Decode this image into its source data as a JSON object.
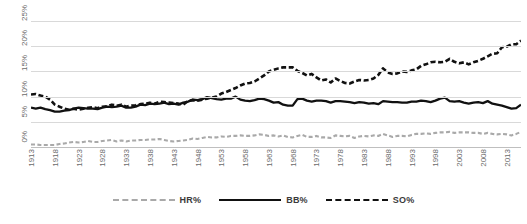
{
  "chart_data": {
    "type": "line",
    "title": "",
    "xlabel": "",
    "ylabel": "",
    "ylim": [
      0,
      25
    ],
    "ytick_labels": [
      "25%",
      "20%",
      "15%",
      "10%",
      "5%",
      "0%"
    ],
    "ytick_values": [
      25,
      20,
      15,
      10,
      5,
      0
    ],
    "grid": true,
    "legend_position": "bottom",
    "x_start": 1913,
    "x_end": 2016,
    "categories": [
      1913,
      1914,
      1915,
      1916,
      1917,
      1918,
      1919,
      1920,
      1921,
      1922,
      1923,
      1924,
      1925,
      1926,
      1927,
      1928,
      1929,
      1930,
      1931,
      1932,
      1933,
      1934,
      1935,
      1936,
      1937,
      1938,
      1939,
      1940,
      1941,
      1942,
      1943,
      1944,
      1945,
      1946,
      1947,
      1948,
      1949,
      1950,
      1951,
      1952,
      1953,
      1954,
      1955,
      1956,
      1957,
      1958,
      1959,
      1960,
      1961,
      1962,
      1963,
      1964,
      1965,
      1966,
      1967,
      1968,
      1969,
      1970,
      1971,
      1972,
      1973,
      1974,
      1975,
      1976,
      1977,
      1978,
      1979,
      1980,
      1981,
      1982,
      1983,
      1984,
      1985,
      1986,
      1987,
      1988,
      1989,
      1990,
      1991,
      1992,
      1993,
      1994,
      1995,
      1996,
      1997,
      1998,
      1999,
      2000,
      2001,
      2002,
      2003,
      2004,
      2005,
      2006,
      2007,
      2008,
      2009,
      2010,
      2011,
      2012,
      2013,
      2014,
      2015,
      2016
    ],
    "xtick_labels": [
      "1913",
      "1918",
      "1923",
      "1928",
      "1933",
      "1938",
      "1943",
      "1948",
      "1953",
      "1958",
      "1963",
      "1968",
      "1973",
      "1978",
      "1983",
      "1988",
      "1993",
      "1998",
      "2003",
      "2008",
      "2013"
    ],
    "series": [
      {
        "name": "HR%",
        "style": "dotted",
        "color": "#a9a9a9",
        "values": [
          0.5,
          0.5,
          0.4,
          0.4,
          0.4,
          0.4,
          0.6,
          0.7,
          0.9,
          1.0,
          0.9,
          1.0,
          1.2,
          1.0,
          1.0,
          1.2,
          1.3,
          1.4,
          1.1,
          1.3,
          1.1,
          1.3,
          1.3,
          1.4,
          1.4,
          1.5,
          1.5,
          1.6,
          1.4,
          1.2,
          1.1,
          1.2,
          1.3,
          1.4,
          1.7,
          1.6,
          1.8,
          2.0,
          1.9,
          1.9,
          2.1,
          2.0,
          2.2,
          2.2,
          2.3,
          2.2,
          2.2,
          2.3,
          2.5,
          2.4,
          2.2,
          2.3,
          2.1,
          2.3,
          2.0,
          1.9,
          2.2,
          2.4,
          2.0,
          2.0,
          2.2,
          1.9,
          1.9,
          1.8,
          2.3,
          2.2,
          2.1,
          2.2,
          1.8,
          2.1,
          2.2,
          2.1,
          2.3,
          2.2,
          2.6,
          2.3,
          2.0,
          2.2,
          2.2,
          2.1,
          2.4,
          2.6,
          2.6,
          2.7,
          2.6,
          2.8,
          2.9,
          2.9,
          3.0,
          2.8,
          2.9,
          2.9,
          2.9,
          2.8,
          2.8,
          2.6,
          2.8,
          2.6,
          2.5,
          2.6,
          2.5,
          2.3,
          2.6,
          3.0
        ]
      },
      {
        "name": "BB%",
        "style": "solid",
        "color": "#111111",
        "values": [
          7.8,
          7.6,
          7.8,
          7.5,
          7.3,
          7.0,
          7.0,
          7.2,
          7.3,
          7.6,
          7.8,
          7.7,
          7.6,
          7.6,
          7.5,
          7.8,
          8.0,
          7.9,
          8.0,
          8.2,
          7.8,
          7.8,
          8.0,
          8.4,
          8.3,
          8.6,
          8.5,
          8.6,
          8.8,
          8.5,
          8.6,
          8.4,
          8.8,
          9.0,
          9.4,
          9.3,
          9.5,
          9.9,
          9.7,
          9.5,
          9.4,
          9.6,
          9.6,
          10.0,
          9.4,
          9.2,
          9.1,
          9.3,
          9.6,
          9.5,
          9.2,
          8.8,
          8.9,
          8.4,
          8.2,
          8.2,
          9.5,
          9.6,
          9.2,
          9.0,
          9.2,
          9.2,
          9.1,
          8.8,
          9.1,
          9.1,
          9.0,
          8.9,
          8.7,
          8.9,
          8.8,
          8.6,
          8.7,
          8.5,
          9.1,
          9.0,
          8.9,
          8.9,
          8.8,
          8.8,
          9.0,
          9.0,
          9.2,
          9.1,
          8.9,
          9.2,
          9.6,
          9.8,
          9.1,
          9.0,
          9.1,
          8.8,
          8.6,
          8.8,
          8.9,
          8.7,
          9.1,
          8.6,
          8.4,
          8.2,
          7.9,
          7.6,
          7.7,
          8.4
        ]
      },
      {
        "name": "SO%",
        "style": "dashed",
        "color": "#111111",
        "values": [
          10.4,
          10.5,
          10.2,
          10.0,
          9.4,
          8.4,
          8.0,
          7.6,
          7.4,
          7.6,
          7.4,
          7.6,
          7.8,
          7.9,
          7.7,
          8.0,
          8.1,
          8.4,
          8.2,
          8.4,
          8.0,
          8.2,
          8.3,
          8.5,
          8.6,
          8.8,
          8.6,
          9.0,
          8.9,
          8.8,
          8.7,
          8.6,
          8.4,
          9.1,
          9.3,
          9.2,
          9.4,
          9.6,
          9.8,
          10.0,
          10.6,
          10.9,
          11.3,
          11.7,
          12.2,
          12.6,
          12.7,
          13.0,
          13.6,
          14.2,
          15.0,
          15.3,
          15.6,
          15.8,
          15.8,
          15.8,
          15.1,
          14.7,
          14.2,
          14.5,
          13.8,
          13.2,
          13.4,
          12.8,
          13.6,
          13.1,
          12.7,
          12.6,
          13.0,
          13.3,
          13.2,
          13.3,
          13.6,
          14.3,
          15.6,
          14.8,
          14.5,
          14.6,
          15.0,
          14.9,
          15.2,
          15.4,
          16.1,
          16.4,
          16.8,
          16.9,
          16.8,
          16.9,
          17.5,
          16.9,
          16.6,
          16.8,
          16.4,
          16.8,
          17.1,
          17.5,
          18.0,
          18.5,
          18.6,
          19.8,
          19.9,
          20.4,
          20.4,
          21.1
        ]
      }
    ]
  },
  "legend": {
    "items": [
      {
        "label": "HR%"
      },
      {
        "label": "BB%"
      },
      {
        "label": "SO%"
      }
    ]
  }
}
